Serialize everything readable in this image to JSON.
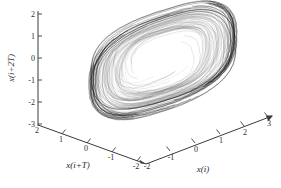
{
  "figure": {
    "kind": "3d-phase-space-plot",
    "width": 281,
    "height": 188,
    "background_color": "#ffffff",
    "line_color": "#111111",
    "axis_color": "#3a3a3a"
  },
  "chart_data": {
    "type": "line",
    "title": "",
    "subtitle": "",
    "projection": "3d",
    "grid": false,
    "legend": null,
    "xlabel": "x(i)",
    "ylabel": "x(i+T)",
    "zlabel": "x(i+2T)",
    "xlim": [
      -2,
      3
    ],
    "ylim": [
      -2,
      2
    ],
    "zlim": [
      -3,
      2
    ],
    "xticks": [
      -2,
      -1,
      0,
      1,
      2,
      3
    ],
    "xticklabels": [
      "-2",
      "-1",
      "0",
      "1",
      "2",
      "3"
    ],
    "yticks": [
      2,
      1,
      0,
      -1,
      -2
    ],
    "yticklabels": [
      "2",
      "1",
      "0",
      "-1",
      "-2"
    ],
    "zticks": [
      2,
      1,
      0,
      -1,
      -2,
      -3
    ],
    "zticklabels": [
      "2",
      "1",
      "0",
      "-1",
      "-2",
      "-3"
    ],
    "series": [
      {
        "name": "reconstructed-trajectory",
        "color": "#111111",
        "n_loops": 46
      }
    ]
  },
  "axes": {
    "z": {
      "label": "x(i+2T)",
      "ticks": [
        {
          "value": "2",
          "x": 38,
          "y": 14
        },
        {
          "value": "1",
          "x": 38,
          "y": 36
        },
        {
          "value": "0",
          "x": 38,
          "y": 58
        },
        {
          "value": "-1",
          "x": 38,
          "y": 80
        },
        {
          "value": "-2",
          "x": 38,
          "y": 102
        },
        {
          "value": "-3",
          "x": 38,
          "y": 124
        }
      ]
    },
    "y": {
      "label": "x(i+T)",
      "ticks": [
        {
          "value": "2",
          "x": 38,
          "y": 125
        },
        {
          "value": "1",
          "x": 62,
          "y": 134
        },
        {
          "value": "0",
          "x": 87,
          "y": 143
        },
        {
          "value": "-1",
          "x": 112,
          "y": 152
        },
        {
          "value": "-2",
          "x": 137,
          "y": 161
        }
      ]
    },
    "x": {
      "label": "x(i)",
      "ticks": [
        {
          "value": "-2",
          "x": 146,
          "y": 160
        },
        {
          "value": "-1",
          "x": 170,
          "y": 151
        },
        {
          "value": "0",
          "x": 195,
          "y": 143
        },
        {
          "value": "1",
          "x": 220,
          "y": 134
        },
        {
          "value": "2",
          "x": 244,
          "y": 126
        },
        {
          "value": "3",
          "x": 268,
          "y": 117
        }
      ]
    }
  }
}
